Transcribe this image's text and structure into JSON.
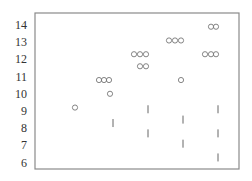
{
  "chart_data": {
    "type": "scatter",
    "title": "",
    "xlabel": "",
    "ylabel": "",
    "ylim": [
      5.5,
      14.5
    ],
    "y_ticks": [
      14,
      13,
      12,
      11,
      10,
      9,
      8,
      7,
      6
    ],
    "grid": false,
    "legend": null,
    "colors": {
      "frame": "#8a8a8a",
      "marker": "#777777",
      "text": "#333333"
    },
    "series": [
      {
        "name": "circles",
        "marker": "circle",
        "points": [
          {
            "x": 75,
            "y": 9.2
          },
          {
            "x": 99,
            "y": 10.8
          },
          {
            "x": 104,
            "y": 10.8
          },
          {
            "x": 109,
            "y": 10.8
          },
          {
            "x": 110,
            "y": 10.0
          },
          {
            "x": 134,
            "y": 12.3
          },
          {
            "x": 140,
            "y": 12.3
          },
          {
            "x": 146,
            "y": 12.3
          },
          {
            "x": 140,
            "y": 11.6
          },
          {
            "x": 146,
            "y": 11.6
          },
          {
            "x": 169,
            "y": 13.1
          },
          {
            "x": 175,
            "y": 13.1
          },
          {
            "x": 181,
            "y": 13.1
          },
          {
            "x": 181,
            "y": 10.8
          },
          {
            "x": 211,
            "y": 13.9
          },
          {
            "x": 216,
            "y": 13.9
          },
          {
            "x": 205,
            "y": 12.3
          },
          {
            "x": 211,
            "y": 12.3
          },
          {
            "x": 216,
            "y": 12.3
          }
        ]
      },
      {
        "name": "ticks",
        "marker": "vline",
        "points": [
          {
            "x": 113,
            "y": 8.3
          },
          {
            "x": 148,
            "y": 9.1
          },
          {
            "x": 148,
            "y": 7.7
          },
          {
            "x": 183,
            "y": 8.5
          },
          {
            "x": 183,
            "y": 7.1
          },
          {
            "x": 218,
            "y": 9.1
          },
          {
            "x": 218,
            "y": 7.7
          },
          {
            "x": 218,
            "y": 6.3
          }
        ]
      }
    ]
  }
}
